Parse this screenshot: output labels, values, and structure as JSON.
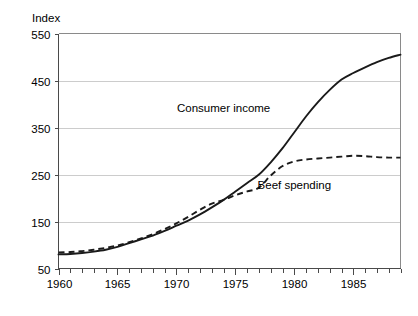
{
  "chart_data": {
    "type": "line",
    "title": "",
    "xlabel": "",
    "ylabel": "Index",
    "xlim": [
      1960,
      1989
    ],
    "ylim": [
      50,
      550
    ],
    "grid": true,
    "legend_position": "inline-annotation",
    "y_ticks": [
      50,
      150,
      250,
      350,
      450,
      550
    ],
    "y_tick_labels": [
      "50",
      "150",
      "250",
      "350",
      "450",
      "550"
    ],
    "x_ticks": [
      1960,
      1965,
      1970,
      1975,
      1980,
      1985
    ],
    "x_tick_labels": [
      "1960",
      "1965",
      "1970",
      "1975",
      "1980",
      "1985"
    ],
    "x_minor_tick_step": 1,
    "x": [
      1960,
      1961,
      1962,
      1963,
      1964,
      1965,
      1966,
      1967,
      1968,
      1969,
      1970,
      1971,
      1972,
      1973,
      1974,
      1975,
      1976,
      1977,
      1978,
      1979,
      1980,
      1981,
      1982,
      1983,
      1984,
      1985,
      1986,
      1987,
      1988,
      1989
    ],
    "series": [
      {
        "name": "Consumer income",
        "style": "solid",
        "color": "#1a1a1a",
        "label_x": 1974,
        "label_y": 392,
        "values": [
          80,
          81,
          83,
          86,
          90,
          96,
          104,
          112,
          120,
          130,
          141,
          152,
          165,
          180,
          196,
          214,
          232,
          250,
          276,
          306,
          340,
          374,
          404,
          430,
          452,
          466,
          478,
          489,
          498,
          505
        ]
      },
      {
        "name": "Beef spending",
        "style": "dashed",
        "color": "#1a1a1a",
        "label_x": 1980,
        "label_y": 228,
        "values": [
          84,
          85,
          87,
          90,
          94,
          99,
          106,
          114,
          123,
          134,
          146,
          160,
          175,
          188,
          196,
          206,
          214,
          222,
          248,
          268,
          278,
          282,
          284,
          286,
          288,
          290,
          289,
          287,
          286,
          286
        ]
      }
    ]
  },
  "axis": {
    "y_title": "Index"
  }
}
